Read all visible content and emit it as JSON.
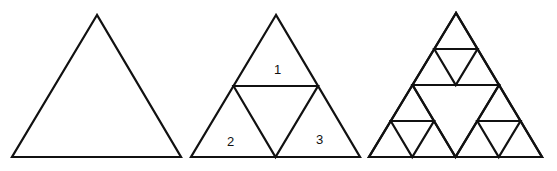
{
  "diagram": {
    "stroke_color": "#111111",
    "background": "#ffffff",
    "stages": [
      {
        "id": "stage-0",
        "apex": [
          97,
          15
        ],
        "left": [
          12,
          157
        ],
        "right": [
          181,
          157
        ],
        "labels": []
      },
      {
        "id": "stage-1",
        "apex": [
          276,
          15
        ],
        "left": [
          191,
          157
        ],
        "right": [
          360,
          157
        ],
        "labels": [
          {
            "text": "1",
            "x": 274,
            "y": 74
          },
          {
            "text": "2",
            "x": 227,
            "y": 146
          },
          {
            "text": "3",
            "x": 316,
            "y": 144
          }
        ]
      },
      {
        "id": "stage-2",
        "apex": [
          456,
          13
        ],
        "left": [
          369,
          157
        ],
        "right": [
          542,
          157
        ],
        "labels": []
      }
    ]
  }
}
